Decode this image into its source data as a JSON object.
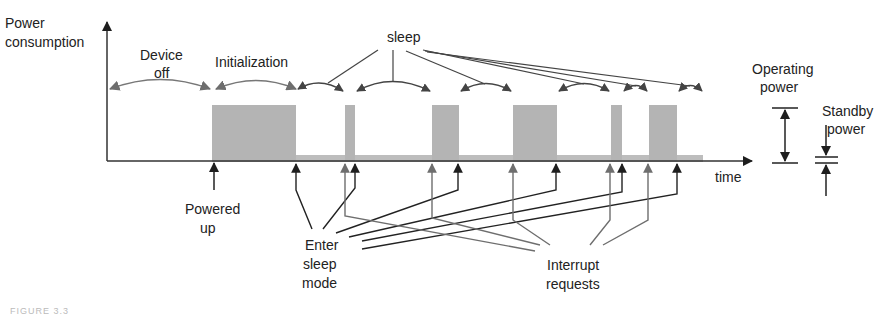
{
  "labels": {
    "y_axis": [
      "Power",
      "consumption"
    ],
    "x_axis": "time",
    "device_off": [
      "Device",
      "off"
    ],
    "initialization": "Initialization",
    "sleep": "sleep",
    "operating_power": [
      "Operating",
      "power"
    ],
    "standby_power": [
      "Standby",
      "power"
    ],
    "powered_up": [
      "Powered",
      "up"
    ],
    "enter_sleep_mode": [
      "Enter",
      "sleep",
      "mode"
    ],
    "interrupt_requests": [
      "Interrupt",
      "requests"
    ],
    "caption": "FIGURE 3.3"
  },
  "colors": {
    "active_block": "#b4b4b4",
    "dark_arrow": "#1e1e1e",
    "gray_arrow": "#6e6e6e",
    "text": "#222222"
  },
  "active_periods": [
    {
      "start": 212,
      "end": 296,
      "phase": "initialization"
    },
    {
      "start": 345,
      "end": 355,
      "phase": "active"
    },
    {
      "start": 432,
      "end": 459,
      "phase": "active"
    },
    {
      "start": 513,
      "end": 557,
      "phase": "active"
    },
    {
      "start": 611,
      "end": 622,
      "phase": "active"
    },
    {
      "start": 649,
      "end": 677,
      "phase": "active"
    }
  ]
}
